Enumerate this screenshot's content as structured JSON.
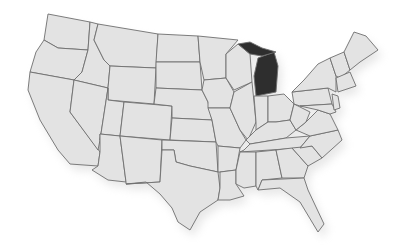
{
  "map": {
    "title": "United States",
    "highlighted_state": "Michigan",
    "colors": {
      "land": "#e3e3e3",
      "border": "#6e6e6e",
      "highlight": "#2e2e2e",
      "background": "#ffffff",
      "shadow": "#bdbdbd"
    },
    "states": [
      {
        "name": "Washington",
        "points": "48,14 90,22 88,50 58,48 44,40"
      },
      {
        "name": "Oregon",
        "points": "44,40 58,48 88,50 82,72 74,80 30,72 36,52"
      },
      {
        "name": "California",
        "points": "30,72 74,80 70,112 100,152 98,166 70,164 58,150 40,120 28,90"
      },
      {
        "name": "Idaho",
        "points": "90,22 98,24 94,40 104,60 110,66 108,88 74,80 82,72 88,50"
      },
      {
        "name": "Nevada",
        "points": "74,80 108,88 100,140 98,150 70,112"
      },
      {
        "name": "Montana",
        "points": "98,24 158,34 156,68 110,66 104,60 94,40"
      },
      {
        "name": "Wyoming",
        "points": "110,66 156,68 154,104 108,100 108,88"
      },
      {
        "name": "Utah",
        "points": "108,88 108,100 124,102 120,136 100,134 100,140"
      },
      {
        "name": "Arizona",
        "points": "100,134 120,136 126,182 108,180 92,170 98,166 100,152"
      },
      {
        "name": "Colorado",
        "points": "124,102 172,106 170,140 120,136"
      },
      {
        "name": "New Mexico",
        "points": "120,136 162,140 160,182 126,184 126,182"
      },
      {
        "name": "North Dakota",
        "points": "158,34 198,36 200,62 156,62"
      },
      {
        "name": "South Dakota",
        "points": "156,62 200,62 202,90 156,88"
      },
      {
        "name": "Nebraska",
        "points": "156,88 202,90 208,102 212,120 172,118 172,106 154,104"
      },
      {
        "name": "Kansas",
        "points": "172,118 212,120 216,142 170,140"
      },
      {
        "name": "Oklahoma",
        "points": "162,140 216,142 218,172 190,166 176,162 174,150 162,150"
      },
      {
        "name": "Texas",
        "points": "162,150 174,150 176,162 190,166 218,172 220,188 218,200 200,212 190,230 178,222 172,208 160,194 146,182 126,184 160,182"
      },
      {
        "name": "Minnesota",
        "points": "198,36 238,40 226,54 226,78 204,80 200,62"
      },
      {
        "name": "Iowa",
        "points": "202,90 204,80 226,78 234,92 230,108 208,108 208,102"
      },
      {
        "name": "Missouri",
        "points": "208,108 230,108 240,130 246,140 240,148 218,146 216,142 212,120"
      },
      {
        "name": "Arkansas",
        "points": "218,146 240,148 236,170 220,172 218,172"
      },
      {
        "name": "Louisiana",
        "points": "220,172 236,170 236,184 244,196 230,200 218,200 220,188"
      },
      {
        "name": "Wisconsin",
        "points": "226,54 238,44 250,54 252,82 234,90 226,78"
      },
      {
        "name": "Illinois",
        "points": "234,92 252,82 256,122 248,140 240,130 230,108"
      },
      {
        "name": "Michigan",
        "points": "258,58 274,52 278,66 276,92 256,96 254,76",
        "hl": true
      },
      {
        "name": "Michigan Upper Peninsula",
        "points": "238,44 250,42 262,48 276,52 262,56 250,54",
        "hl": true
      },
      {
        "name": "Indiana",
        "points": "254,96 268,96 268,122 256,130 256,122"
      },
      {
        "name": "Ohio",
        "points": "268,96 284,94 294,104 290,120 276,122 268,122"
      },
      {
        "name": "Kentucky",
        "points": "246,140 256,130 268,122 276,122 290,120 296,130 286,138 250,144"
      },
      {
        "name": "Tennessee",
        "points": "244,150 250,144 286,138 310,136 300,148 240,152"
      },
      {
        "name": "Mississippi",
        "points": "240,152 256,152 256,186 244,188 236,184 236,170"
      },
      {
        "name": "Alabama",
        "points": "256,152 276,150 282,178 262,180 258,190 256,186"
      },
      {
        "name": "Georgia",
        "points": "276,150 292,148 308,166 304,178 282,178"
      },
      {
        "name": "Florida",
        "points": "258,190 262,180 304,178 308,190 324,224 318,232 300,202 280,188"
      },
      {
        "name": "South Carolina",
        "points": "292,148 312,146 322,158 308,166"
      },
      {
        "name": "North Carolina",
        "points": "300,148 310,136 338,130 342,140 322,158 312,146"
      },
      {
        "name": "Virginia",
        "points": "296,130 306,122 318,110 330,114 338,130 310,136"
      },
      {
        "name": "West Virginia",
        "points": "290,120 294,104 302,108 310,112 306,122 296,130"
      },
      {
        "name": "Pennsylvania",
        "points": "292,92 328,88 332,104 300,106 294,104"
      },
      {
        "name": "New York",
        "points": "294,90 304,80 318,64 330,58 336,76 336,92 328,88 292,92"
      },
      {
        "name": "Maryland/Delaware",
        "points": "300,106 332,104 336,112 330,114 318,110"
      },
      {
        "name": "New Jersey",
        "points": "332,94 338,96 340,108 334,110"
      },
      {
        "name": "Vermont/New Hampshire",
        "points": "330,58 344,52 350,70 340,78 336,76"
      },
      {
        "name": "Massachusetts/CT/RI",
        "points": "336,78 350,72 356,86 338,92"
      },
      {
        "name": "Maine",
        "points": "344,52 354,32 366,36 378,50 360,62 350,70"
      }
    ]
  }
}
